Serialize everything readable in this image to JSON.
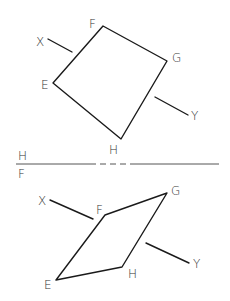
{
  "diagram": {
    "title": "",
    "top_view": {
      "name": "H",
      "vertices": {
        "E": {
          "label": "E",
          "x": 53,
          "y": 83
        },
        "F": {
          "label": "F",
          "x": 103,
          "y": 26
        },
        "G": {
          "label": "G",
          "x": 167,
          "y": 61
        },
        "H": {
          "label": "H",
          "x": 121,
          "y": 139
        }
      },
      "line_x": {
        "label": "X",
        "x1": 48,
        "y1": 39,
        "x2": 72,
        "y2": 52
      },
      "line_y": {
        "label": "Y",
        "x1": 155,
        "y1": 97,
        "x2": 188,
        "y2": 115
      }
    },
    "folding_line": {
      "upper_label": "H",
      "lower_label": "F",
      "y": 164,
      "x_start": 16,
      "x_end": 219,
      "dashed_from": 90,
      "dashed_to": 131
    },
    "front_view": {
      "name": "F",
      "vertices": {
        "E": {
          "label": "E",
          "x": 56,
          "y": 280
        },
        "F": {
          "label": "F",
          "x": 105,
          "y": 215
        },
        "G": {
          "label": "G",
          "x": 167,
          "y": 193
        },
        "H": {
          "label": "H",
          "x": 122,
          "y": 267
        }
      },
      "line_x": {
        "label": "X",
        "x1": 50,
        "y1": 200,
        "x2": 93,
        "y2": 219
      },
      "line_y": {
        "label": "Y",
        "x1": 146,
        "y1": 243,
        "x2": 189,
        "y2": 263
      }
    },
    "colors": {
      "line": "#1a1a1a",
      "text": "#333333",
      "background": "#ffffff"
    }
  }
}
